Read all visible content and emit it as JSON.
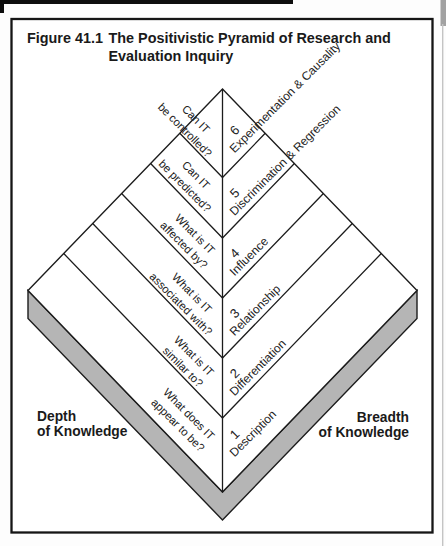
{
  "figure": {
    "label": "Figure 41.1",
    "title_line1": "The Positivistic Pyramid of Research and",
    "title_line2": "Evaluation Inquiry"
  },
  "pyramid": {
    "levels": [
      {
        "number": "6",
        "name": "Experimentation & Causality",
        "question_line1": "Can IT",
        "question_line2": "be controlled?"
      },
      {
        "number": "5",
        "name": "Discrimination & Regression",
        "question_line1": "Can IT",
        "question_line2": "be predicted?"
      },
      {
        "number": "4",
        "name": "Influence",
        "question_line1": "What is IT",
        "question_line2": "affected by?"
      },
      {
        "number": "3",
        "name": "Relationship",
        "question_line1": "What is IT",
        "question_line2": "associated with?"
      },
      {
        "number": "2",
        "name": "Differentiation",
        "question_line1": "What is IT",
        "question_line2": "similar to?"
      },
      {
        "number": "1",
        "name": "Description",
        "question_line1": "What does IT",
        "question_line2": "appear to be?"
      }
    ],
    "axis_labels": {
      "left_line1": "Depth",
      "left_line2": "of Knowledge",
      "right_line1": "Breadth",
      "right_line2": "of Knowledge"
    }
  },
  "colors": {
    "base_shadow": "#b5b5b5",
    "line": "#1c1c1c",
    "scan_bar": "#0d0d0d"
  }
}
